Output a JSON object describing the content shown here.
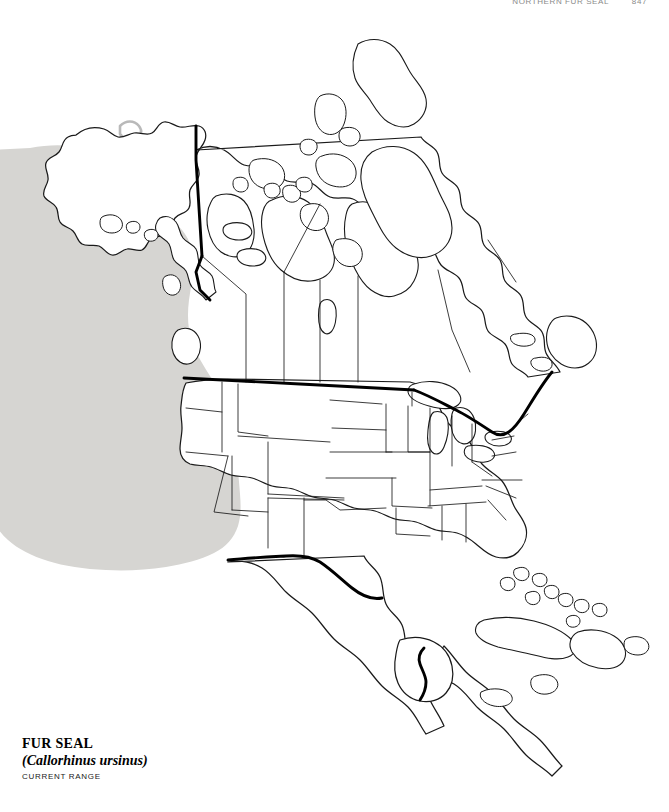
{
  "page": {
    "running_head_title": "NORTHERN FUR SEAL",
    "running_head_page": "847",
    "background_color": "#ffffff"
  },
  "caption": {
    "common_name": "FUR SEAL",
    "scientific_name": "(Callorhinus ursinus)",
    "range_label": "CURRENT RANGE"
  },
  "map": {
    "title": "North America distribution map",
    "projection_note": "North America, Central America and Caribbean outline map",
    "colors": {
      "range_fill": "#d6d5d2",
      "coastline": "#1a1a1a",
      "national_border": "#000000",
      "state_border": "#1a1a1a",
      "land_fill": "#ffffff",
      "ocean_fill": "#ffffff"
    },
    "legend": {
      "range_swatch_label": "CURRENT RANGE",
      "range_swatch_color": "#d6d5d2"
    },
    "features": [
      {
        "name": "north-pacific-range-shading",
        "type": "range-polygon",
        "fill": "#d6d5d2"
      },
      {
        "name": "alaska",
        "type": "landmass"
      },
      {
        "name": "canada",
        "type": "landmass"
      },
      {
        "name": "canadian-arctic-archipelago",
        "type": "islands"
      },
      {
        "name": "hudson-bay",
        "type": "water-body"
      },
      {
        "name": "great-lakes",
        "type": "water-body"
      },
      {
        "name": "united-states",
        "type": "landmass"
      },
      {
        "name": "mexico",
        "type": "landmass"
      },
      {
        "name": "baja-california",
        "type": "peninsula"
      },
      {
        "name": "central-america",
        "type": "landmass"
      },
      {
        "name": "florida-peninsula",
        "type": "peninsula"
      },
      {
        "name": "cuba",
        "type": "island"
      },
      {
        "name": "hispaniola",
        "type": "island"
      },
      {
        "name": "jamaica",
        "type": "island"
      },
      {
        "name": "puerto-rico",
        "type": "island"
      },
      {
        "name": "bahamas",
        "type": "islands"
      },
      {
        "name": "newfoundland",
        "type": "island"
      },
      {
        "name": "vancouver-island",
        "type": "island"
      },
      {
        "name": "aleutian-coast",
        "type": "coastline"
      }
    ],
    "borders": [
      {
        "name": "usa-canada-border",
        "weight": "thick"
      },
      {
        "name": "usa-mexico-border",
        "weight": "thick"
      },
      {
        "name": "mexico-guatemala-border",
        "weight": "thick"
      },
      {
        "name": "alaska-yukon-border",
        "weight": "thick"
      },
      {
        "name": "us-state-borders",
        "weight": "thin"
      },
      {
        "name": "canadian-province-borders",
        "weight": "thin"
      }
    ]
  }
}
